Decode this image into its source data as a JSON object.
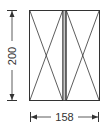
{
  "diagram": {
    "type": "window-elevation",
    "panels": [
      {
        "id": "left-sash",
        "opening": "fixed-x"
      },
      {
        "id": "right-sash",
        "opening": "fixed-x"
      }
    ],
    "dimensions": {
      "height": {
        "value": "200",
        "orientation": "vertical"
      },
      "width": {
        "value": "158",
        "orientation": "horizontal"
      }
    },
    "colors": {
      "stroke": "#333333",
      "mullion_fill": "#c8c8c8",
      "background": "#ffffff"
    }
  }
}
